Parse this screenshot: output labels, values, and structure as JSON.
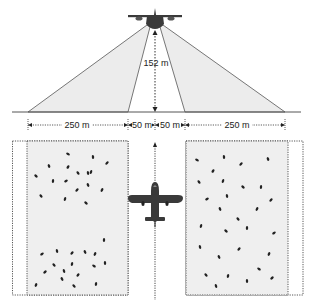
{
  "diagram": {
    "altitude_label": "152 m",
    "dimensions": [
      {
        "label": "250 m",
        "x_from": 28,
        "x_to": 128
      },
      {
        "label": "50 m",
        "x_from": 128,
        "x_to": 155
      },
      {
        "label": "50 m",
        "x_from": 155,
        "x_to": 185
      },
      {
        "label": "250 m",
        "x_from": 185,
        "x_to": 285
      }
    ],
    "colors": {
      "beam_fill": "#ececec",
      "strip_fill": "#efefef",
      "line": "#444444",
      "aircraft": "#3a3a3a",
      "animal": "#222222"
    },
    "icons": {
      "aircraft_front": "aircraft-front-view-icon",
      "aircraft_top": "aircraft-top-view-icon",
      "animal": "animal-dot-icon"
    },
    "left_strip_animals": [
      [
        68,
        154
      ],
      [
        93,
        157
      ],
      [
        107,
        163
      ],
      [
        49,
        166
      ],
      [
        68,
        167
      ],
      [
        78,
        173
      ],
      [
        91,
        172
      ],
      [
        36,
        176
      ],
      [
        53,
        181
      ],
      [
        66,
        181
      ],
      [
        88,
        173
      ],
      [
        77,
        190
      ],
      [
        88,
        185
      ],
      [
        102,
        190
      ],
      [
        41,
        196
      ],
      [
        65,
        199
      ],
      [
        86,
        203
      ],
      [
        104,
        240
      ],
      [
        42,
        254
      ],
      [
        57,
        251
      ],
      [
        72,
        253
      ],
      [
        85,
        252
      ],
      [
        95,
        254
      ],
      [
        54,
        265
      ],
      [
        72,
        264
      ],
      [
        94,
        266
      ],
      [
        105,
        263
      ],
      [
        45,
        272
      ],
      [
        64,
        271
      ],
      [
        78,
        275
      ],
      [
        62,
        279
      ],
      [
        36,
        285
      ],
      [
        74,
        286
      ],
      [
        96,
        284
      ]
    ],
    "right_strip_animals": [
      [
        197,
        160
      ],
      [
        224,
        157
      ],
      [
        241,
        164
      ],
      [
        268,
        159
      ],
      [
        213,
        171
      ],
      [
        199,
        182
      ],
      [
        223,
        181
      ],
      [
        243,
        187
      ],
      [
        261,
        187
      ],
      [
        207,
        199
      ],
      [
        227,
        196
      ],
      [
        271,
        200
      ],
      [
        220,
        209
      ],
      [
        257,
        209
      ],
      [
        238,
        219
      ],
      [
        201,
        226
      ],
      [
        226,
        231
      ],
      [
        247,
        228
      ],
      [
        274,
        233
      ],
      [
        200,
        247
      ],
      [
        239,
        249
      ],
      [
        219,
        257
      ],
      [
        269,
        254
      ],
      [
        206,
        275
      ],
      [
        228,
        276
      ],
      [
        259,
        269
      ],
      [
        247,
        281
      ],
      [
        272,
        278
      ],
      [
        216,
        286
      ]
    ]
  }
}
